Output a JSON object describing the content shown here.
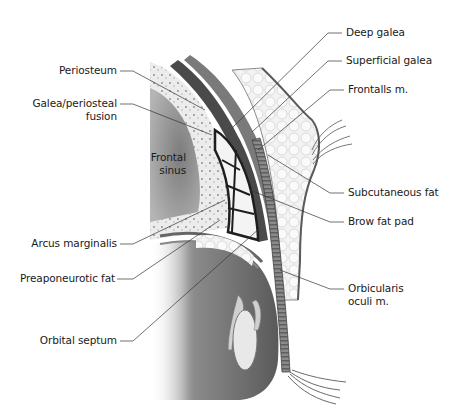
{
  "figure": {
    "labels_left": [
      {
        "id": "periosteum",
        "text": "Periosteum"
      },
      {
        "id": "galea-periosteal-fusion",
        "line1": "Galea/periosteal",
        "line2": "fusion"
      },
      {
        "id": "arcus-marginalis",
        "text": "Arcus marginalis"
      },
      {
        "id": "preaponeurotic-fat",
        "text": "Preaponeurotic fat"
      },
      {
        "id": "orbital-septum",
        "text": "Orbital septum"
      }
    ],
    "labels_right": [
      {
        "id": "deep-galea",
        "text": "Deep galea"
      },
      {
        "id": "superficial-galea",
        "text": "Superficial galea"
      },
      {
        "id": "frontalis",
        "text": "Frontalls m."
      },
      {
        "id": "subcutaneous-fat",
        "text": "Subcutaneous fat"
      },
      {
        "id": "brow-fat-pad",
        "text": "Brow fat pad"
      },
      {
        "id": "orbicularis-oculi",
        "line1": "Orbicularis",
        "line2": "oculi m."
      }
    ],
    "labels_inner": [
      {
        "id": "frontal-sinus",
        "line1": "Frontal",
        "line2": "sinus"
      }
    ],
    "colors": {
      "background": "#ffffff",
      "text": "#1a1a1a",
      "leader_line": "#333333",
      "bone": "#e6e6e6",
      "sinus": "#9a9a9a",
      "fat": "#f2f2f2",
      "muscle": "#6e6e6e",
      "septum": "#2b2b2b"
    }
  }
}
